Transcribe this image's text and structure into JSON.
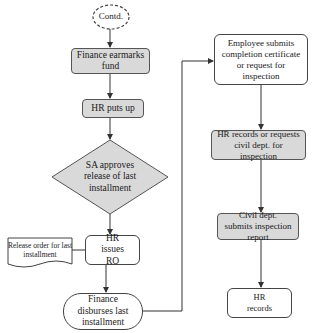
{
  "diagram": {
    "type": "flowchart",
    "colors": {
      "process_fill": "#d9d9d9",
      "decision_fill": "#d9d9d9",
      "plain_fill": "#ffffff",
      "stroke": "#444444"
    },
    "nodes": {
      "contd": {
        "label": "Contd.",
        "shape": "dashed-ellipse"
      },
      "finance_earmarks": {
        "label": "Finance earmarks fund",
        "shape": "shaded-rounded-rect"
      },
      "hr_puts_up": {
        "label": "HR puts up",
        "shape": "shaded-rounded-rect"
      },
      "sa_approves": {
        "label": "SA approves release of last installment",
        "shape": "diamond"
      },
      "hr_issues_ro": {
        "label": "HR issues RO",
        "shape": "rounded-rect"
      },
      "release_order": {
        "label": "Release order for last installment",
        "shape": "document"
      },
      "finance_disburses": {
        "label": "Finance disburses last installment",
        "shape": "terminator"
      },
      "employee_submits": {
        "label": "Employee submits completion certificate or request for inspection",
        "shape": "rounded-rect"
      },
      "hr_records_requests": {
        "label": "HR records or requests civil dept. for inspection",
        "shape": "shaded-rounded-rect"
      },
      "civil_dept_submits": {
        "label": "Civil dept. submits inspection report",
        "shape": "shaded-rounded-rect"
      },
      "hr_records": {
        "label": "HR records",
        "shape": "rounded-rect"
      }
    },
    "edges": [
      [
        "contd",
        "finance_earmarks"
      ],
      [
        "finance_earmarks",
        "hr_puts_up"
      ],
      [
        "hr_puts_up",
        "sa_approves"
      ],
      [
        "sa_approves",
        "hr_issues_ro"
      ],
      [
        "hr_issues_ro",
        "release_order"
      ],
      [
        "hr_issues_ro",
        "finance_disburses"
      ],
      [
        "finance_disburses",
        "employee_submits"
      ],
      [
        "employee_submits",
        "hr_records_requests"
      ],
      [
        "hr_records_requests",
        "civil_dept_submits"
      ],
      [
        "civil_dept_submits",
        "hr_records"
      ]
    ]
  }
}
